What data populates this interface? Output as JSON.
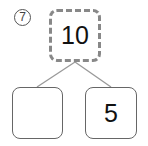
{
  "problem_number": "7",
  "top_box": {
    "value": "10",
    "style": "dashed"
  },
  "bottom_left_box": {
    "value": ""
  },
  "bottom_right_box": {
    "value": "5"
  },
  "colors": {
    "border": "#666666",
    "dashed_border": "#888888",
    "connector": "#999999"
  }
}
